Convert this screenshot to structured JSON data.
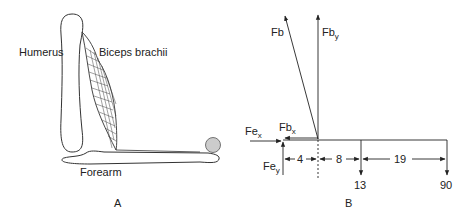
{
  "panel_a": {
    "label": "A",
    "humerus_label": "Humerus",
    "biceps_label": "Biceps brachii",
    "forearm_label": "Forearm",
    "ball_color": "#cccccc"
  },
  "panel_b": {
    "label": "B",
    "forces": {
      "fb": {
        "main": "Fb",
        "sub": ""
      },
      "fby": {
        "main": "Fb",
        "sub": "y"
      },
      "fbx": {
        "main": "Fb",
        "sub": "x"
      },
      "fex": {
        "main": "Fe",
        "sub": "x"
      },
      "fey": {
        "main": "Fe",
        "sub": "y"
      }
    },
    "distances": [
      "4",
      "8",
      "19"
    ],
    "loads": [
      "13",
      "90"
    ]
  }
}
